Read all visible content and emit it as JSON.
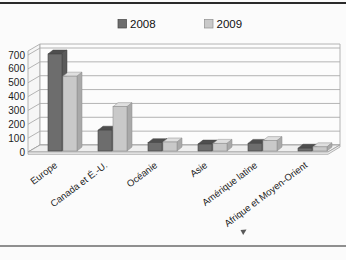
{
  "page": {
    "background": "#fbfbfb",
    "top_border_color": "#2a2a2a",
    "bottom_border_color": "#8f8f8f"
  },
  "chart_data": {
    "type": "bar",
    "style": "3d-column",
    "title": "",
    "xlabel": "",
    "ylabel": "",
    "categories": [
      "Europe",
      "Canada et É.-U.",
      "Océanie",
      "Asie",
      "Amérique latine",
      "Afrique et Moyen-Orient"
    ],
    "series": [
      {
        "name": "2008",
        "color": "#6d6d6d",
        "top_color": "#4e4e4e",
        "side_color": "#5a5a5a",
        "edge_color": "#454545",
        "values": [
          700,
          150,
          60,
          50,
          55,
          20
        ]
      },
      {
        "name": "2009",
        "color": "#c9c9c9",
        "top_color": "#dfdfdf",
        "side_color": "#a9a9a9",
        "edge_color": "#8f8f8f",
        "values": [
          540,
          320,
          65,
          55,
          75,
          30
        ]
      }
    ],
    "ylim": [
      0,
      700
    ],
    "ytick_step": 100,
    "yticks": [
      "0",
      "100",
      "200",
      "300",
      "400",
      "500",
      "600",
      "700"
    ],
    "grid": true,
    "gridline_color": "#ababab",
    "wall_color": "#fcfcfc",
    "side_wall_color": "#f6f6f6",
    "floor_color": "#efefef",
    "floor_edge_color": "#ededed",
    "legend_position": "top",
    "axis_text_color": "#1c1c1c",
    "legend_text_color": "#111111"
  }
}
